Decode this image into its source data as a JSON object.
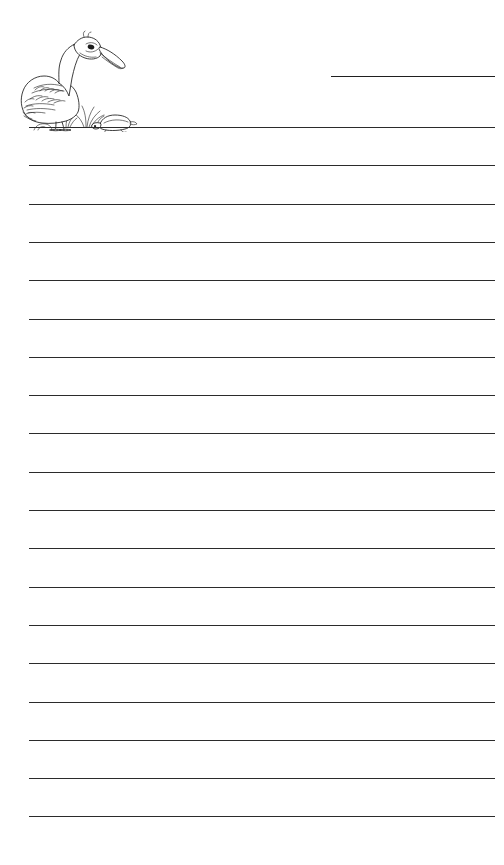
{
  "page": {
    "kind": "lined-stationery-sheet",
    "width": 504,
    "height": 865,
    "background_color": "#ffffff",
    "ink_color": "#2b2b2b"
  },
  "title_rule": {
    "name": "title-write-line",
    "label": "",
    "x_start": 331,
    "x_end": 495,
    "y": 76,
    "thickness": 1.9,
    "color": "#1f1f1f"
  },
  "illustration": {
    "name": "pelican-on-shore-illustration",
    "subject": "pelican",
    "companions": [
      "turtle",
      "grass-tuft",
      "rock"
    ],
    "style": "black-and-white line drawing",
    "x": 12,
    "y": 26,
    "width": 130,
    "height": 106,
    "stroke_color": "#1c1c1c"
  },
  "ruled_lines": {
    "name": "writing-lines",
    "count": 19,
    "x_start": 29,
    "x_end": 495,
    "first_y": 127,
    "spacing": 38.3,
    "thickness": 1.6,
    "color": "#2b2b2b",
    "y_positions": [
      127.0,
      165.3,
      203.6,
      241.9,
      280.2,
      318.5,
      356.8,
      395.1,
      433.4,
      471.7,
      510.0,
      548.3,
      586.6,
      624.9,
      663.2,
      701.5,
      739.8,
      778.1,
      816.4,
      854.7
    ]
  }
}
